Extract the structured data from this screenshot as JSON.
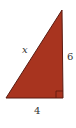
{
  "diagram": {
    "type": "right-triangle",
    "fill_color": "#a8341f",
    "stroke_color": "#5a1a10",
    "labels": {
      "hypotenuse": "x",
      "vertical_leg": "6",
      "horizontal_leg": "4"
    },
    "right_angle_marker": true
  }
}
